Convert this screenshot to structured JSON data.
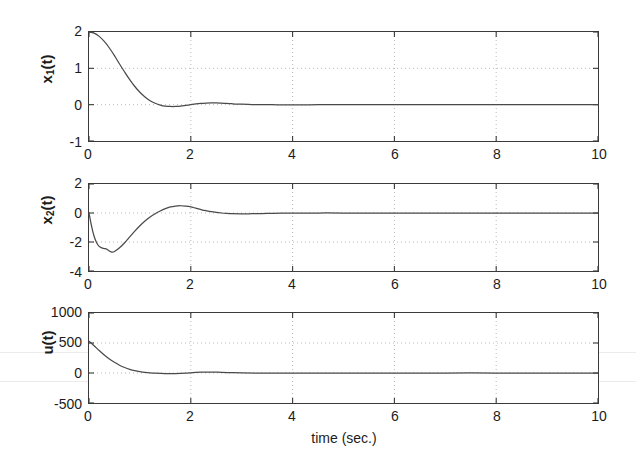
{
  "figure": {
    "title": "",
    "xlabel": "time (sec.)",
    "background_color": "#ffffff",
    "line_color": "#4a4a4a",
    "axis_color": "#3a3a3a",
    "grid_color": "#b8b8b8"
  },
  "panels": [
    {
      "name": "x1",
      "ylabel_main": "x",
      "ylabel_sub": "1",
      "ylabel_tail": "(t)",
      "yticks": [
        "2",
        "1",
        "0",
        "-1"
      ],
      "xticks": [
        "0",
        "2",
        "4",
        "6",
        "8",
        "10"
      ]
    },
    {
      "name": "x2",
      "ylabel_main": "x",
      "ylabel_sub": "2",
      "ylabel_tail": "(t)",
      "yticks": [
        "2",
        "0",
        "-2",
        "-4"
      ],
      "xticks": [
        "0",
        "2",
        "4",
        "6",
        "8",
        "10"
      ]
    },
    {
      "name": "u",
      "ylabel_main": "u",
      "ylabel_sub": "",
      "ylabel_tail": "(t)",
      "yticks": [
        "1000",
        "500",
        "0",
        "-500"
      ],
      "xticks": [
        "0",
        "2",
        "4",
        "6",
        "8",
        "10"
      ]
    }
  ],
  "chart_data": [
    {
      "type": "line",
      "title": "",
      "xlabel": "",
      "ylabel": "x_1(t)",
      "xlim": [
        0,
        10
      ],
      "ylim": [
        -1,
        2
      ],
      "xticks": [
        0,
        2,
        4,
        6,
        8,
        10
      ],
      "yticks": [
        -1,
        0,
        1,
        2
      ],
      "grid": true,
      "legend": "none",
      "series": [
        {
          "name": "x1(t)",
          "x": [
            0,
            0.1,
            0.2,
            0.3,
            0.4,
            0.5,
            0.6,
            0.7,
            0.8,
            0.9,
            1.0,
            1.1,
            1.2,
            1.3,
            1.4,
            1.5,
            1.6,
            1.7,
            1.8,
            1.9,
            2.0,
            2.1,
            2.2,
            2.3,
            2.4,
            2.5,
            2.6,
            2.7,
            2.8,
            2.9,
            3.0,
            3.2,
            3.4,
            3.6,
            3.8,
            4.0,
            4.5,
            5.0,
            5.5,
            6.0,
            7.0,
            8.0,
            9.0,
            10.0
          ],
          "y": [
            2.0,
            1.97,
            1.88,
            1.74,
            1.56,
            1.35,
            1.12,
            0.9,
            0.69,
            0.5,
            0.34,
            0.21,
            0.11,
            0.04,
            -0.01,
            -0.04,
            -0.05,
            -0.05,
            -0.04,
            -0.02,
            0.0,
            0.02,
            0.035,
            0.045,
            0.05,
            0.048,
            0.042,
            0.034,
            0.026,
            0.018,
            0.012,
            0.004,
            0.0,
            -0.002,
            -0.003,
            -0.003,
            -0.002,
            -0.001,
            0.0,
            0.0,
            0.0,
            0.0,
            0.0,
            0.0
          ]
        }
      ]
    },
    {
      "type": "line",
      "title": "",
      "xlabel": "",
      "ylabel": "x_2(t)",
      "xlim": [
        0,
        10
      ],
      "ylim": [
        -4,
        2
      ],
      "xticks": [
        0,
        2,
        4,
        6,
        8,
        10
      ],
      "yticks": [
        -4,
        -2,
        0,
        2
      ],
      "grid": true,
      "legend": "none",
      "series": [
        {
          "name": "x2(t)",
          "x": [
            0,
            0.05,
            0.1,
            0.15,
            0.2,
            0.25,
            0.3,
            0.35,
            0.4,
            0.45,
            0.5,
            0.6,
            0.7,
            0.8,
            0.9,
            1.0,
            1.1,
            1.2,
            1.3,
            1.4,
            1.5,
            1.6,
            1.7,
            1.8,
            1.9,
            2.0,
            2.1,
            2.2,
            2.3,
            2.4,
            2.5,
            2.6,
            2.7,
            2.8,
            3.0,
            3.2,
            3.5,
            3.8,
            4.0,
            4.5,
            5.0,
            6.0,
            7.0,
            8.0,
            9.0,
            10.0
          ],
          "y": [
            0.0,
            -0.9,
            -1.6,
            -2.05,
            -2.3,
            -2.4,
            -2.45,
            -2.5,
            -2.62,
            -2.7,
            -2.66,
            -2.4,
            -2.05,
            -1.65,
            -1.25,
            -0.88,
            -0.55,
            -0.27,
            -0.05,
            0.14,
            0.3,
            0.42,
            0.48,
            0.5,
            0.47,
            0.42,
            0.33,
            0.24,
            0.16,
            0.09,
            0.04,
            0.0,
            -0.03,
            -0.05,
            -0.06,
            -0.05,
            -0.03,
            -0.015,
            -0.01,
            0.0,
            0.0,
            0.0,
            0.0,
            0.0,
            0.0,
            0.0
          ]
        }
      ]
    },
    {
      "type": "line",
      "title": "",
      "xlabel": "time (sec.)",
      "ylabel": "u(t)",
      "xlim": [
        0,
        10
      ],
      "ylim": [
        -500,
        1000
      ],
      "xticks": [
        0,
        2,
        4,
        6,
        8,
        10
      ],
      "yticks": [
        -500,
        0,
        500,
        1000
      ],
      "grid": true,
      "legend": "none",
      "series": [
        {
          "name": "u(t)",
          "x": [
            0,
            0.1,
            0.2,
            0.3,
            0.4,
            0.5,
            0.6,
            0.7,
            0.8,
            0.9,
            1.0,
            1.1,
            1.2,
            1.3,
            1.4,
            1.5,
            1.6,
            1.7,
            1.8,
            1.9,
            2.0,
            2.1,
            2.2,
            2.3,
            2.4,
            2.5,
            2.6,
            2.8,
            3.0,
            3.5,
            4.0,
            5.0,
            6.0,
            7.0,
            8.0,
            9.0,
            10.0
          ],
          "y": [
            530,
            455,
            375,
            300,
            235,
            178,
            130,
            92,
            62,
            40,
            24,
            12,
            4,
            -2,
            -6,
            -9,
            -10,
            -9,
            -6,
            -2,
            4,
            10,
            14,
            16,
            16,
            14,
            11,
            6,
            2,
            -2,
            -3,
            -2,
            -1,
            0,
            0,
            0,
            0
          ]
        }
      ]
    }
  ]
}
